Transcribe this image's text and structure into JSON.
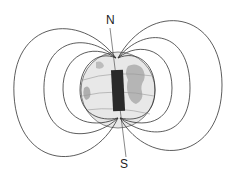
{
  "diagram": {
    "labels": {
      "north": "N",
      "south": "S"
    },
    "colors": {
      "field_line": "#333333",
      "magnet": "#2a2a2a",
      "globe": "#e6e6e6",
      "land": "#9a9a9a",
      "background": "#ffffff"
    },
    "elements": [
      "magnetic-field-lines",
      "globe",
      "bar-magnet",
      "rotation-axis",
      "north-pole-label",
      "south-pole-label"
    ]
  }
}
